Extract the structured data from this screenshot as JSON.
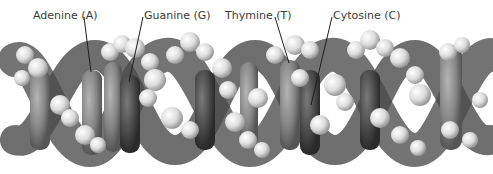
{
  "figure": {
    "labels": [
      {
        "text": "Adenine (A)",
        "x": 33,
        "y": 9
      },
      {
        "text": "Guanine (G)",
        "x": 144,
        "y": 9
      },
      {
        "text": "Thymine (T)",
        "x": 225,
        "y": 9
      },
      {
        "text": "Cytosine (C)",
        "x": 333,
        "y": 9
      }
    ],
    "leader_lines": [
      {
        "from": [
          84,
          17
        ],
        "to": [
          91,
          72
        ]
      },
      {
        "from": [
          143,
          17
        ],
        "to": [
          129,
          82
        ]
      },
      {
        "from": [
          275,
          17
        ],
        "to": [
          289,
          63
        ]
      },
      {
        "from": [
          332,
          17
        ],
        "to": [
          311,
          105
        ]
      }
    ],
    "colors": {
      "background": "#ffffff",
      "text": "#3a3a3a",
      "dark_atom": "#3c3c3c",
      "mid_atom": "#7a7a7a",
      "light_atom": "#e6e6e6"
    }
  }
}
